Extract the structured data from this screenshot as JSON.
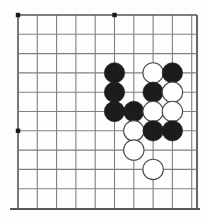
{
  "figure": {
    "kind": "go-board-diagram"
  },
  "board": {
    "background_color": "#fdfdfd",
    "line_color": "#808080",
    "edge_line_color": "#555555",
    "star_point_color": "#1a1a1a",
    "width_px": 207,
    "height_px": 217,
    "origin_x": 18,
    "origin_y": 15,
    "spacing": 19.3,
    "cols": 10,
    "rows": 10,
    "top_edge_row": 0,
    "left_edge_col": 0,
    "bottom_edge_row": 9,
    "right_edge_col": 9,
    "star_points": [
      {
        "col": 0,
        "row": 0
      },
      {
        "col": 5,
        "row": 0
      },
      {
        "col": 0,
        "row": 6
      }
    ]
  },
  "stones": {
    "black_color": "#1c1c1c",
    "white_fill": "#ffffff",
    "white_stroke": "#4a4a4a",
    "radius": 10.2,
    "count_black": 10,
    "count_white": 8,
    "count_total": 18,
    "list": [
      {
        "color": "black",
        "col": 5,
        "row": 3,
        "label": "B1"
      },
      {
        "color": "white",
        "col": 7,
        "row": 3,
        "label": "W1"
      },
      {
        "color": "black",
        "col": 8,
        "row": 3,
        "label": "B2"
      },
      {
        "color": "black",
        "col": 5,
        "row": 4,
        "label": "B3"
      },
      {
        "color": "black",
        "col": 7,
        "row": 4,
        "label": "B4"
      },
      {
        "color": "white",
        "col": 8,
        "row": 4,
        "label": "W2"
      },
      {
        "color": "black",
        "col": 5,
        "row": 5,
        "label": "B5"
      },
      {
        "color": "black",
        "col": 6,
        "row": 5,
        "label": "B6"
      },
      {
        "color": "white",
        "col": 7,
        "row": 5,
        "label": "W3"
      },
      {
        "color": "white",
        "col": 8,
        "row": 5,
        "label": "W4"
      },
      {
        "color": "white",
        "col": 6,
        "row": 6,
        "label": "W5"
      },
      {
        "color": "black",
        "col": 7,
        "row": 6,
        "label": "B7"
      },
      {
        "color": "black",
        "col": 8,
        "row": 6,
        "label": "B8"
      },
      {
        "color": "white",
        "col": 6,
        "row": 7,
        "label": "W6"
      },
      {
        "color": "white",
        "col": 7,
        "row": 8,
        "label": "W7"
      }
    ]
  }
}
